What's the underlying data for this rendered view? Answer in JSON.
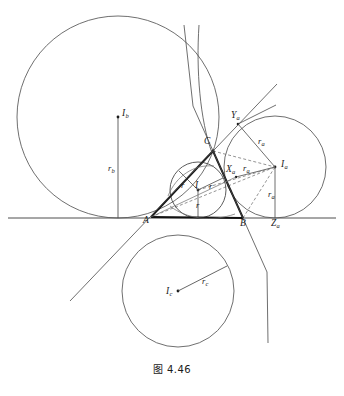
{
  "figure": {
    "caption": "图 4.46",
    "corner_mark": ""
  },
  "colors": {
    "stroke": "#3a3a3a",
    "stroke_bold": "#111111",
    "stroke_light": "#6b6b6b",
    "text": "#1b1b1b",
    "background": "#ffffff"
  },
  "vertices": [
    {
      "id": "A",
      "label": "A",
      "x": 151,
      "y": 217,
      "label_x": 143,
      "label_y": 216
    },
    {
      "id": "B",
      "label": "B",
      "x": 243,
      "y": 218,
      "label_x": 240,
      "label_y": 219
    },
    {
      "id": "C",
      "label": "C",
      "x": 213,
      "y": 151,
      "label_x": 204,
      "label_y": 137
    }
  ],
  "incircle": {
    "center_label": "I",
    "center_label_sub": "",
    "radius_label": "r",
    "cx": 198,
    "cy": 190,
    "r": 28,
    "center_label_x": 195,
    "center_label_y": 182,
    "radius_labels": [
      {
        "text": "r",
        "x": 181,
        "y": 182
      },
      {
        "text": "r",
        "x": 210,
        "y": 183
      },
      {
        "text": "r",
        "x": 196,
        "y": 203
      }
    ]
  },
  "excircle_a": {
    "center_label": "I",
    "center_sub": "a",
    "radius_label": "r",
    "radius_sub": "a",
    "cx": 275,
    "cy": 167,
    "r": 51,
    "center_label_x": 281,
    "center_label_y": 161,
    "tangent_points": [
      {
        "id": "Xa",
        "label": "X",
        "sub": "a",
        "x": 236,
        "y": 177,
        "label_x": 226,
        "label_y": 166
      },
      {
        "id": "Ya",
        "label": "Y",
        "sub": "a",
        "x": 238,
        "y": 124,
        "label_x": 231,
        "label_y": 112
      },
      {
        "id": "Za",
        "label": "Z",
        "sub": "a",
        "x": 275,
        "y": 218,
        "label_x": 272,
        "label_y": 220
      }
    ],
    "radius_labels": [
      {
        "text": "r",
        "sub": "a",
        "x": 258,
        "y": 138
      },
      {
        "text": "r",
        "sub": "a",
        "x": 245,
        "y": 165
      },
      {
        "text": "r",
        "sub": "a",
        "x": 268,
        "y": 192
      }
    ]
  },
  "excircle_b": {
    "center_label": "I",
    "center_sub": "b",
    "radius_label": "r",
    "radius_sub": "b",
    "cx": 118,
    "cy": 117,
    "r": 101,
    "center_label_x": 122,
    "center_label_y": 110,
    "tangent_point": {
      "x": 118,
      "y": 218
    },
    "radius_label_pos": {
      "x": 110,
      "y": 165
    }
  },
  "excircle_c": {
    "center_label": "I",
    "center_sub": "c",
    "radius_label": "r",
    "radius_sub": "c",
    "cx": 178,
    "cy": 291,
    "r": 56,
    "center_label_x": 167,
    "center_label_y": 288,
    "radius_endpoint": {
      "x": 227,
      "y": 266
    },
    "radius_label_pos": {
      "x": 203,
      "y": 278
    }
  },
  "baseline": {
    "y": 218,
    "x_start": 8,
    "x_end": 336
  }
}
